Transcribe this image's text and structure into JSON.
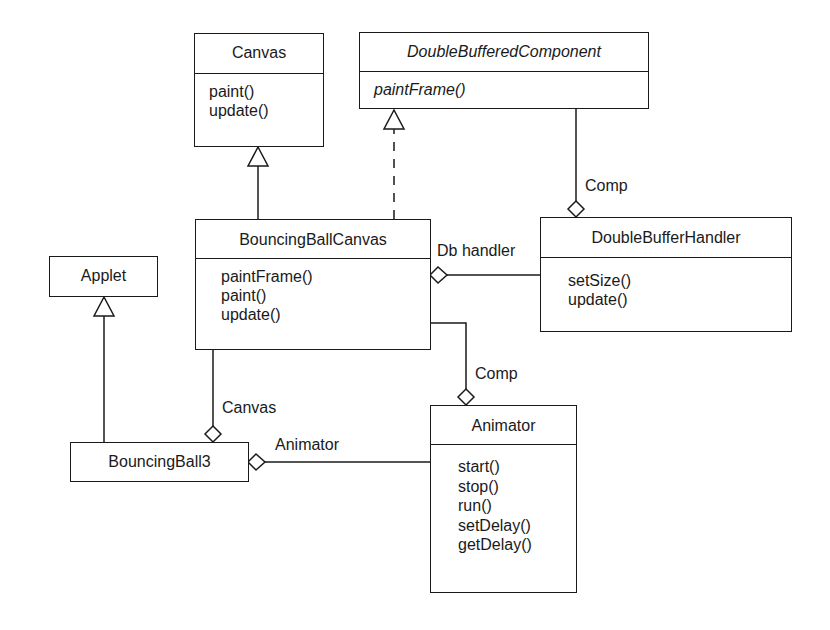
{
  "classes": {
    "canvas": {
      "name": "Canvas",
      "operations": [
        "paint()",
        "update()"
      ]
    },
    "double_buffered_component": {
      "name": "DoubleBufferedComponent",
      "abstract": true,
      "operations": [
        "paintFrame()"
      ]
    },
    "bouncing_ball_canvas": {
      "name": "BouncingBallCanvas",
      "operations": [
        "paintFrame()",
        "paint()",
        "update()"
      ]
    },
    "double_buffer_handler": {
      "name": "DoubleBufferHandler",
      "operations": [
        "setSize()",
        "update()"
      ]
    },
    "applet": {
      "name": "Applet",
      "operations": []
    },
    "bouncing_ball3": {
      "name": "BouncingBall3",
      "operations": []
    },
    "animator": {
      "name": "Animator",
      "operations": [
        "start()",
        "stop()",
        "run()",
        "setDelay()",
        "getDelay()"
      ]
    }
  },
  "relationships": [
    {
      "type": "generalization",
      "from": "BouncingBallCanvas",
      "to": "Canvas"
    },
    {
      "type": "realization",
      "from": "BouncingBallCanvas",
      "to": "DoubleBufferedComponent"
    },
    {
      "type": "aggregation",
      "whole": "DoubleBufferHandler",
      "part": "DoubleBufferedComponent",
      "role": "Comp"
    },
    {
      "type": "aggregation",
      "whole": "BouncingBallCanvas",
      "part": "DoubleBufferHandler",
      "role": "Db handler"
    },
    {
      "type": "generalization",
      "from": "BouncingBall3",
      "to": "Applet"
    },
    {
      "type": "aggregation",
      "whole": "BouncingBall3",
      "part": "BouncingBallCanvas",
      "role": "Canvas"
    },
    {
      "type": "aggregation",
      "whole": "Animator",
      "part": "BouncingBallCanvas",
      "role": "Comp"
    },
    {
      "type": "aggregation",
      "whole": "BouncingBall3",
      "part": "Animator",
      "role": "Animator"
    }
  ],
  "labels": {
    "comp_top": "Comp",
    "db_handler": "Db handler",
    "comp_bottom": "Comp",
    "canvas_role": "Canvas",
    "animator_role": "Animator"
  }
}
